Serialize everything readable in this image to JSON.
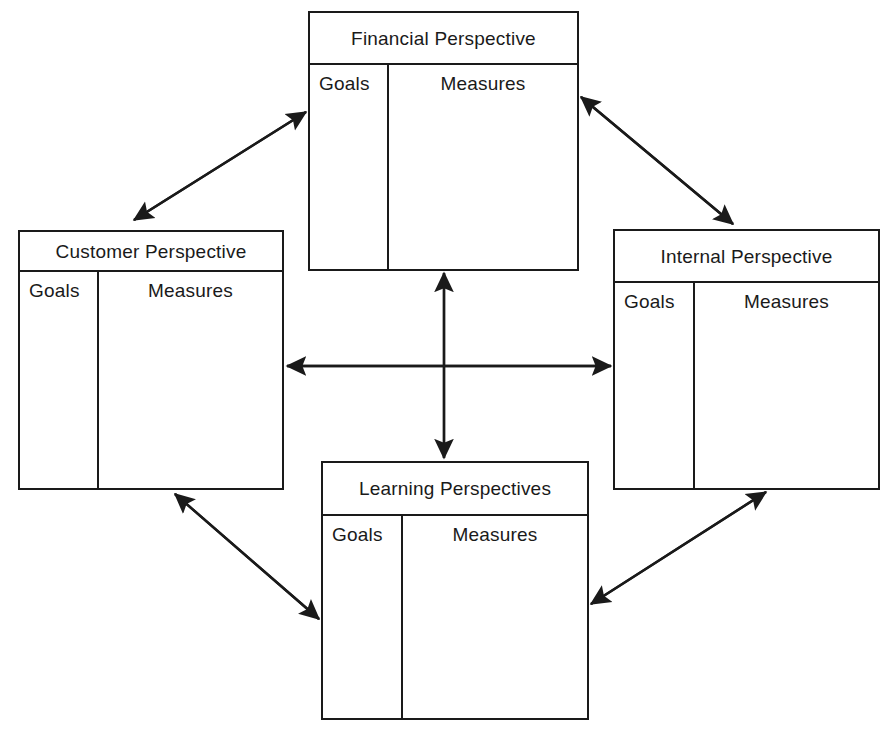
{
  "diagram": {
    "canvas": {
      "width": 895,
      "height": 736,
      "background": "#ffffff"
    },
    "line_color": "#1a1a1a",
    "text_color": "#1a1a1a"
  },
  "boxes": [
    {
      "id": "financial",
      "title": "Financial Perspective",
      "goals_label": "Goals",
      "measures_label": "Measures"
    },
    {
      "id": "customer",
      "title": "Customer Perspective",
      "goals_label": "Goals",
      "measures_label": "Measures"
    },
    {
      "id": "internal",
      "title": "Internal Perspective",
      "goals_label": "Goals",
      "measures_label": "Measures"
    },
    {
      "id": "learning",
      "title": "Learning Perspectives",
      "goals_label": "Goals",
      "measures_label": "Measures"
    }
  ],
  "connectors": [
    {
      "id": "financial-customer",
      "from": "financial",
      "to": "customer",
      "style": "double-headed",
      "orientation": "diagonal"
    },
    {
      "id": "financial-internal",
      "from": "financial",
      "to": "internal",
      "style": "double-headed",
      "orientation": "diagonal"
    },
    {
      "id": "customer-learning",
      "from": "customer",
      "to": "learning",
      "style": "double-headed",
      "orientation": "diagonal"
    },
    {
      "id": "internal-learning",
      "from": "internal",
      "to": "learning",
      "style": "double-headed",
      "orientation": "diagonal"
    },
    {
      "id": "financial-learning",
      "from": "financial",
      "to": "learning",
      "style": "double-headed",
      "orientation": "vertical"
    },
    {
      "id": "customer-internal",
      "from": "customer",
      "to": "internal",
      "style": "double-headed",
      "orientation": "horizontal"
    }
  ]
}
